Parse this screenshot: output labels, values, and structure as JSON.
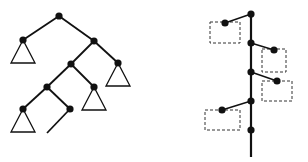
{
  "diagram": {
    "left": {
      "type": "binary-tree",
      "nodes": [
        {
          "id": "root",
          "x": 59,
          "y": 16
        },
        {
          "id": "a",
          "x": 23,
          "y": 40
        },
        {
          "id": "b",
          "x": 94,
          "y": 41
        },
        {
          "id": "c",
          "x": 71,
          "y": 64
        },
        {
          "id": "d",
          "x": 118,
          "y": 63
        },
        {
          "id": "e",
          "x": 47,
          "y": 87
        },
        {
          "id": "f",
          "x": 94,
          "y": 87
        },
        {
          "id": "g",
          "x": 23,
          "y": 109
        },
        {
          "id": "h",
          "x": 70,
          "y": 109
        }
      ],
      "edges": [
        [
          "root",
          "a"
        ],
        [
          "root",
          "b"
        ],
        [
          "b",
          "c"
        ],
        [
          "b",
          "d"
        ],
        [
          "c",
          "e"
        ],
        [
          "c",
          "f"
        ],
        [
          "e",
          "g"
        ],
        [
          "e",
          "h"
        ]
      ],
      "subtrees": [
        "a",
        "d",
        "f",
        "g"
      ],
      "open_edge": {
        "from": "h",
        "to": [
          47,
          133
        ]
      }
    },
    "right": {
      "type": "spine-with-branches",
      "spine_x": 251,
      "spine_range": [
        14,
        157
      ],
      "spine_nodes": [
        14,
        43,
        72,
        101,
        130
      ],
      "branches": [
        {
          "from_y": 14,
          "node": [
            225,
            23
          ],
          "box": [
            210,
            22,
            30,
            21
          ]
        },
        {
          "from_y": 43,
          "node": [
            274,
            50
          ],
          "box": [
            262,
            49,
            24,
            23
          ]
        },
        {
          "from_y": 72,
          "node": [
            277,
            81
          ],
          "box": [
            262,
            81,
            30,
            20
          ]
        },
        {
          "from_y": 101,
          "node": [
            222,
            110
          ],
          "box": [
            205,
            110,
            35,
            20
          ]
        }
      ]
    },
    "colors": {
      "stroke": "#111111",
      "box": "#333333",
      "bg": "#ffffff"
    }
  }
}
